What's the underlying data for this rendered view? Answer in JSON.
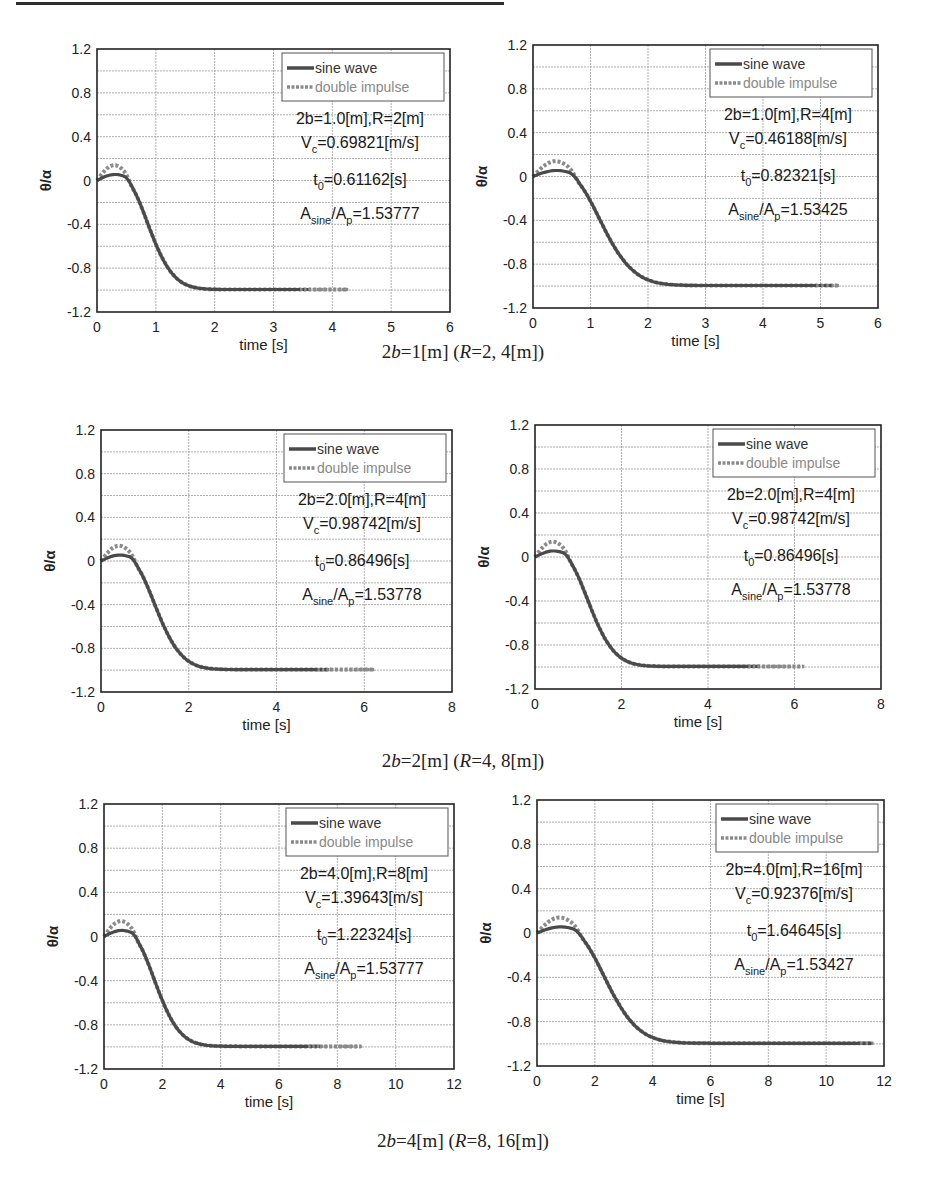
{
  "page": {
    "captions": [
      {
        "prefix": "2",
        "var1": "b",
        "mid": "=1[m] (",
        "var2": "R",
        "suffix": "=2, 4[m])"
      },
      {
        "prefix": "2",
        "var1": "b",
        "mid": "=2[m] (",
        "var2": "R",
        "suffix": "=4, 8[m])"
      },
      {
        "prefix": "2",
        "var1": "b",
        "mid": "=4[m] (",
        "var2": "R",
        "suffix": "=8, 16[m])"
      }
    ]
  },
  "colors": {
    "sine": "#4a4a4a",
    "impulse": "#8a8a8a",
    "grid": "#9a9a9a",
    "axis": "#222222"
  },
  "chart_data": [
    {
      "type": "line",
      "id": "plot-1a",
      "box": {
        "x": 97,
        "y": 49,
        "w": 353,
        "h": 263
      },
      "title": "",
      "xlabel": "time [s]",
      "ylabel": "θ/α",
      "xlim": [
        0,
        6
      ],
      "ylim": [
        -1.2,
        1.2
      ],
      "xticks": [
        0,
        1,
        2,
        3,
        4,
        5,
        6
      ],
      "yticks": [
        "1.2",
        "0.8",
        "0.4",
        "0",
        "-0.4",
        "-0.8",
        "-1.2"
      ],
      "grid": true,
      "legend": [
        "sine wave",
        "double impulse"
      ],
      "legend_position": "upper right",
      "annotation": {
        "l1": "2b=1.0[m],R=2[m]",
        "vc": "=0.69821[m/s]",
        "t0": "=0.61162[s]",
        "ratio": "=1.53777"
      },
      "t_scale": 0.61162,
      "t_end_sine": 3.6,
      "t_end_impulse": 4.25,
      "series": [
        {
          "name": "sine wave",
          "x": [
            0,
            0.3,
            0.6,
            0.9,
            1.2,
            1.5,
            2.0,
            2.5,
            3.0,
            3.6
          ],
          "values": [
            0,
            0.05,
            -0.08,
            -0.45,
            -0.72,
            -0.87,
            -0.95,
            -0.98,
            -0.99,
            -0.99
          ]
        },
        {
          "name": "double impulse",
          "x": [
            0,
            0.3,
            0.6,
            0.9,
            1.2,
            1.5,
            2.0,
            2.5,
            3.0,
            4.25
          ],
          "values": [
            0,
            0.14,
            0.02,
            -0.42,
            -0.71,
            -0.87,
            -0.95,
            -0.98,
            -0.99,
            -0.99
          ]
        }
      ]
    },
    {
      "type": "line",
      "id": "plot-1b",
      "box": {
        "x": 533,
        "y": 45,
        "w": 345,
        "h": 263
      },
      "title": "",
      "xlabel": "time [s]",
      "ylabel": "θ/α",
      "xlim": [
        0,
        6
      ],
      "ylim": [
        -1.2,
        1.2
      ],
      "xticks": [
        0,
        1,
        2,
        3,
        4,
        5,
        6
      ],
      "yticks": [
        "1.2",
        "0.8",
        "0.4",
        "0",
        "-0.4",
        "-0.8",
        "-1.2"
      ],
      "grid": true,
      "legend": [
        "sine wave",
        "double impulse"
      ],
      "legend_position": "upper right",
      "annotation": {
        "l1": "2b=1.0[m],R=4[m]",
        "vc": "=0.46188[m/s]",
        "t0": "=0.82321[s]",
        "ratio": "=1.53425"
      },
      "t_scale": 0.82321,
      "t_end_sine": 5.2,
      "t_end_impulse": 5.3,
      "series": [
        {
          "name": "sine wave",
          "x": [
            0,
            0.4,
            0.8,
            1.2,
            1.6,
            2.0,
            2.5,
            3.0,
            4.0,
            5.2
          ],
          "values": [
            0,
            0.05,
            -0.1,
            -0.45,
            -0.7,
            -0.83,
            -0.92,
            -0.96,
            -0.98,
            -0.99
          ]
        },
        {
          "name": "double impulse",
          "x": [
            0,
            0.4,
            0.8,
            1.2,
            1.6,
            2.0,
            2.5,
            3.0,
            4.0,
            5.3
          ],
          "values": [
            0,
            0.13,
            0.0,
            -0.43,
            -0.7,
            -0.83,
            -0.92,
            -0.96,
            -0.98,
            -0.99
          ]
        }
      ]
    },
    {
      "type": "line",
      "id": "plot-2a",
      "box": {
        "x": 101,
        "y": 430,
        "w": 351,
        "h": 262
      },
      "title": "",
      "xlabel": "time [s]",
      "ylabel": "θ/α",
      "xlim": [
        0,
        8
      ],
      "ylim": [
        -1.2,
        1.2
      ],
      "xticks": [
        0,
        2,
        4,
        6,
        8
      ],
      "yticks": [
        "1.2",
        "0.8",
        "0.4",
        "0",
        "-0.4",
        "-0.8",
        "-1.2"
      ],
      "grid": true,
      "legend": [
        "sine wave",
        "double impulse"
      ],
      "legend_position": "upper right",
      "annotation": {
        "l1": "2b=2.0[m],R=4[m]",
        "vc": "=0.98742[m/s]",
        "t0": "=0.86496[s]",
        "ratio": "=1.53778"
      },
      "t_scale": 0.86496,
      "t_end_sine": 5.2,
      "t_end_impulse": 6.2,
      "series": [
        {
          "name": "sine wave",
          "x": [
            0,
            0.45,
            0.9,
            1.3,
            1.7,
            2.1,
            2.7,
            3.4,
            4.2,
            5.2
          ],
          "values": [
            0,
            0.05,
            -0.1,
            -0.45,
            -0.7,
            -0.84,
            -0.93,
            -0.97,
            -0.99,
            -0.99
          ]
        },
        {
          "name": "double impulse",
          "x": [
            0,
            0.45,
            0.9,
            1.3,
            1.7,
            2.1,
            2.7,
            3.4,
            4.2,
            6.2
          ],
          "values": [
            0,
            0.14,
            0.02,
            -0.43,
            -0.7,
            -0.84,
            -0.93,
            -0.97,
            -0.99,
            -0.99
          ]
        }
      ]
    },
    {
      "type": "line",
      "id": "plot-2b",
      "box": {
        "x": 535,
        "y": 425,
        "w": 346,
        "h": 264
      },
      "title": "",
      "xlabel": "time [s]",
      "ylabel": "θ/α",
      "xlim": [
        0,
        8
      ],
      "ylim": [
        -1.2,
        1.2
      ],
      "xticks": [
        0,
        2,
        4,
        6,
        8
      ],
      "yticks": [
        "1.2",
        "0.8",
        "0.4",
        "0",
        "-0.4",
        "-0.8",
        "-1.2"
      ],
      "grid": true,
      "legend": [
        "sine wave",
        "double impulse"
      ],
      "legend_position": "upper right",
      "annotation": {
        "l1": "2b=2.0[m],R=4[m]",
        "vc": "=0.98742[m/s]",
        "t0": "=0.86496[s]",
        "ratio": "=1.53778"
      },
      "t_scale": 0.86496,
      "t_end_sine": 5.2,
      "t_end_impulse": 6.2,
      "series": [
        {
          "name": "sine wave",
          "x": [
            0,
            0.45,
            0.9,
            1.3,
            1.7,
            2.1,
            2.7,
            3.4,
            4.2,
            5.2
          ],
          "values": [
            0,
            0.05,
            -0.1,
            -0.45,
            -0.7,
            -0.84,
            -0.93,
            -0.97,
            -0.99,
            -0.99
          ]
        },
        {
          "name": "double impulse",
          "x": [
            0,
            0.45,
            0.9,
            1.3,
            1.7,
            2.1,
            2.7,
            3.4,
            4.2,
            6.2
          ],
          "values": [
            0,
            0.14,
            0.02,
            -0.43,
            -0.7,
            -0.84,
            -0.93,
            -0.97,
            -0.99,
            -0.99
          ]
        }
      ]
    },
    {
      "type": "line",
      "id": "plot-3a",
      "box": {
        "x": 104,
        "y": 804,
        "w": 350,
        "h": 265
      },
      "title": "",
      "xlabel": "time [s]",
      "ylabel": "θ/α",
      "xlim": [
        0,
        12
      ],
      "ylim": [
        -1.2,
        1.2
      ],
      "xticks": [
        0,
        2,
        4,
        6,
        8,
        10,
        12
      ],
      "yticks": [
        "1.2",
        "0.8",
        "0.4",
        "0",
        "-0.4",
        "-0.8",
        "-1.2"
      ],
      "grid": true,
      "legend": [
        "sine wave",
        "double impulse"
      ],
      "legend_position": "upper right",
      "annotation": {
        "l1": "2b=4.0[m],R=8[m]",
        "vc": "=1.39643[m/s]",
        "t0": "=1.22324[s]",
        "ratio": "=1.53777"
      },
      "t_scale": 1.22324,
      "t_end_sine": 7.4,
      "t_end_impulse": 8.8,
      "series": [
        {
          "name": "sine wave",
          "x": [
            0,
            0.65,
            1.3,
            1.8,
            2.4,
            3.0,
            3.8,
            4.8,
            6.0,
            7.4
          ],
          "values": [
            0,
            0.05,
            -0.1,
            -0.45,
            -0.7,
            -0.84,
            -0.93,
            -0.97,
            -0.99,
            -0.99
          ]
        },
        {
          "name": "double impulse",
          "x": [
            0,
            0.65,
            1.3,
            1.8,
            2.4,
            3.0,
            3.8,
            4.8,
            6.0,
            8.8
          ],
          "values": [
            0,
            0.14,
            0.02,
            -0.43,
            -0.7,
            -0.84,
            -0.93,
            -0.97,
            -0.99,
            -0.99
          ]
        }
      ]
    },
    {
      "type": "line",
      "id": "plot-3b",
      "box": {
        "x": 537,
        "y": 800,
        "w": 347,
        "h": 266
      },
      "title": "",
      "xlabel": "time [s]",
      "ylabel": "θ/α",
      "xlim": [
        0,
        12
      ],
      "ylim": [
        -1.2,
        1.2
      ],
      "xticks": [
        0,
        2,
        4,
        6,
        8,
        10,
        12
      ],
      "yticks": [
        "1.2",
        "0.8",
        "0.4",
        "0",
        "-0.4",
        "-0.8",
        "-1.2"
      ],
      "grid": true,
      "legend": [
        "sine wave",
        "double impulse"
      ],
      "legend_position": "upper right",
      "annotation": {
        "l1": "2b=4.0[m],R=16[m]",
        "vc": "=0.92376[m/s]",
        "t0": "=1.64645[s]",
        "ratio": "=1.53427"
      },
      "t_scale": 1.64645,
      "t_end_sine": 11.6,
      "t_end_impulse": 11.6,
      "series": [
        {
          "name": "sine wave",
          "x": [
            0,
            0.85,
            1.7,
            2.4,
            3.2,
            4.0,
            5.0,
            6.5,
            8.5,
            11.6
          ],
          "values": [
            0,
            0.05,
            -0.1,
            -0.45,
            -0.7,
            -0.83,
            -0.92,
            -0.96,
            -0.98,
            -0.99
          ]
        },
        {
          "name": "double impulse",
          "x": [
            0,
            0.85,
            1.7,
            2.4,
            3.2,
            4.0,
            5.0,
            6.5,
            8.5,
            11.6
          ],
          "values": [
            0,
            0.13,
            0.0,
            -0.43,
            -0.7,
            -0.83,
            -0.92,
            -0.96,
            -0.98,
            -0.99
          ]
        }
      ]
    }
  ]
}
